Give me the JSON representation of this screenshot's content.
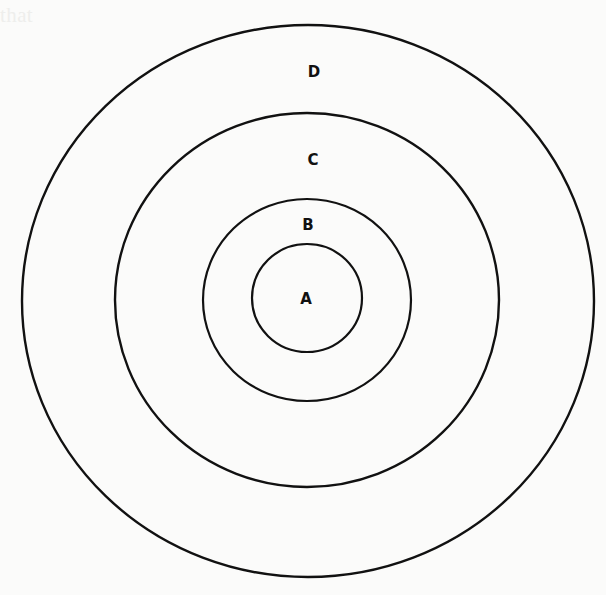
{
  "diagram": {
    "type": "concentric-circles",
    "rings": [
      {
        "label": "A",
        "cx": 307,
        "cy": 298,
        "rx": 55,
        "ry": 54,
        "label_x": 306,
        "label_y": 303
      },
      {
        "label": "B",
        "cx": 307,
        "cy": 300,
        "rx": 104,
        "ry": 101,
        "label_x": 308,
        "label_y": 230
      },
      {
        "label": "C",
        "cx": 307,
        "cy": 300,
        "rx": 192,
        "ry": 187,
        "label_x": 313,
        "label_y": 165
      },
      {
        "label": "D",
        "cx": 308,
        "cy": 301,
        "rx": 286,
        "ry": 276,
        "label_x": 314,
        "label_y": 77
      }
    ],
    "labels": {
      "a": "A",
      "b": "B",
      "c": "C",
      "d": "D"
    },
    "stroke_color": "#111111"
  },
  "background_text": "show-through print from reverse side (illegible)"
}
